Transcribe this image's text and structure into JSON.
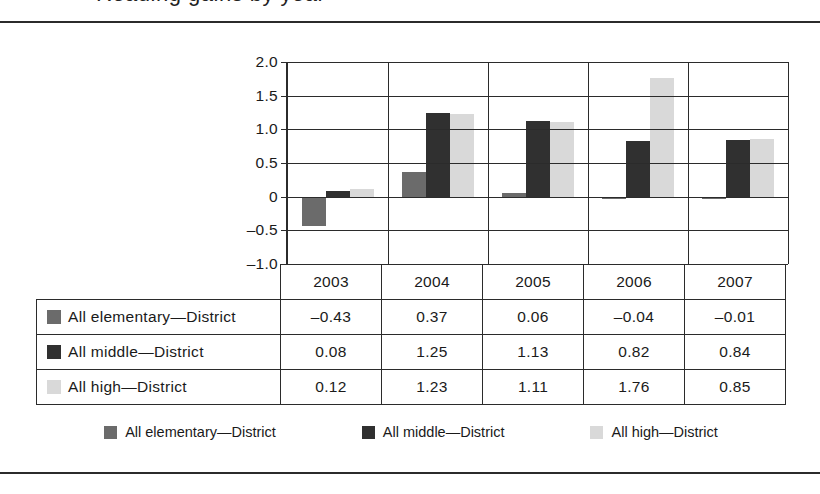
{
  "figure": {
    "title_remnant": "Reading gains by year",
    "frame_color": "#2b2b2b"
  },
  "chart_data": {
    "type": "bar",
    "title": "",
    "xlabel": "",
    "ylabel": "",
    "categories": [
      "2003",
      "2004",
      "2005",
      "2006",
      "2007"
    ],
    "series": [
      {
        "name": "All elementary—District",
        "color": "#6b6b6b",
        "values": [
          -0.43,
          0.37,
          0.06,
          -0.04,
          -0.01
        ]
      },
      {
        "name": "All middle—District",
        "color": "#303030",
        "values": [
          0.08,
          1.25,
          1.13,
          0.82,
          0.84
        ]
      },
      {
        "name": "All high—District",
        "color": "#d9d9d9",
        "values": [
          0.12,
          1.23,
          1.11,
          1.76,
          0.85
        ]
      }
    ],
    "ylim": [
      -1.0,
      2.0
    ],
    "yticks": [
      "2.0",
      "1.5",
      "1.0",
      "0.5",
      "0",
      "-0.5",
      "-1.0"
    ],
    "ytick_labels": [
      "2.0",
      "1.5",
      "1.0",
      "0.5",
      "0",
      "–0.5",
      "–1.0"
    ],
    "grid": true,
    "legend_position": "bottom"
  },
  "table": {
    "corner_label": "",
    "column_headers": [
      "2003",
      "2004",
      "2005",
      "2006",
      "2007"
    ],
    "rows": [
      {
        "label": "All elementary—District",
        "swatch": "elem",
        "values": [
          "–0.43",
          "0.37",
          "0.06",
          "–0.04",
          "–0.01"
        ]
      },
      {
        "label": "All middle—District",
        "swatch": "mid",
        "values": [
          "0.08",
          "1.25",
          "1.13",
          "0.82",
          "0.84"
        ]
      },
      {
        "label": "All high—District",
        "swatch": "high",
        "values": [
          "0.12",
          "1.23",
          "1.11",
          "1.76",
          "0.85"
        ]
      }
    ]
  },
  "legend": {
    "items": [
      {
        "label": "All elementary—District",
        "swatch": "elem"
      },
      {
        "label": "All middle—District",
        "swatch": "mid"
      },
      {
        "label": "All high—District",
        "swatch": "high"
      }
    ]
  }
}
